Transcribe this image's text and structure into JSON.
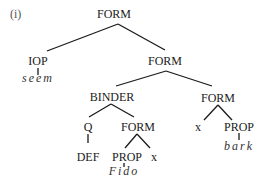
{
  "example_label": "(i)",
  "tree": {
    "root": "FORM",
    "iop": "IOP",
    "iop_word": "seem",
    "form_right": "FORM",
    "binder": "BINDER",
    "quantifier": "Q",
    "quantifier_word": "DEF",
    "binder_form": "FORM",
    "binder_prop": "PROP",
    "binder_prop_word": "Fido",
    "binder_var": "x",
    "scope_form": "FORM",
    "scope_var": "x",
    "scope_prop": "PROP",
    "scope_prop_word": "bark"
  }
}
